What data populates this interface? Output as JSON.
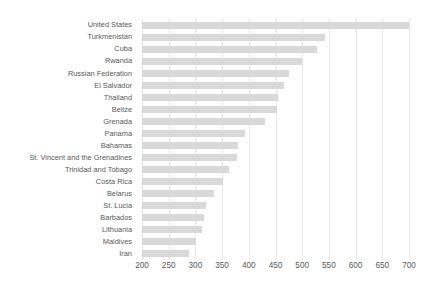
{
  "chart_data": {
    "type": "bar",
    "orientation": "horizontal",
    "title": "",
    "xlabel": "",
    "ylabel": "",
    "xlim": [
      200,
      700
    ],
    "xticks": [
      200,
      250,
      300,
      350,
      400,
      450,
      500,
      550,
      600,
      650,
      700
    ],
    "grid": true,
    "legend": null,
    "bar_color": "#d9d9d9",
    "label_color": "#595959",
    "gridline_color": "#e8e8e8",
    "categories": [
      "United States",
      "Turkmenistan",
      "Cuba",
      "Rwanda",
      "Russian Federation",
      "El Salvador",
      "Thailand",
      "Belize",
      "Grenada",
      "Panama",
      "Bahamas",
      "St. Vincent and the Grenadines",
      "Trinidad and Tobago",
      "Costa Rica",
      "Belarus",
      "St. Lucia",
      "Barbados",
      "Lithuania",
      "Maldives",
      "Iran"
    ],
    "values": [
      700,
      543,
      528,
      500,
      475,
      465,
      455,
      452,
      430,
      392,
      380,
      378,
      362,
      352,
      335,
      320,
      317,
      313,
      302,
      288
    ]
  }
}
